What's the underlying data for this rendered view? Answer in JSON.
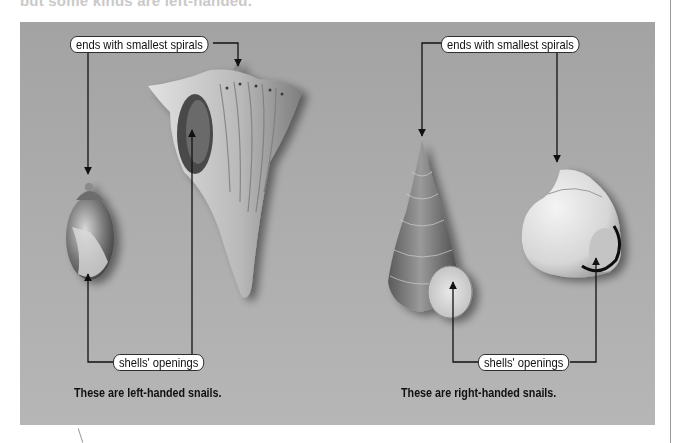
{
  "header": {
    "partial_text": "but some kinds are left-handed."
  },
  "figure": {
    "background_color": "#acacac",
    "left_group": {
      "top_label": "ends with smallest spirals",
      "bottom_label": "shells' openings",
      "caption": "These are left-handed snails.",
      "shells": [
        "small-oval-shell",
        "whelk-conch-shell"
      ]
    },
    "right_group": {
      "top_label": "ends with smallest spirals",
      "bottom_label": "shells' openings",
      "caption": "These are right-handed snails.",
      "shells": [
        "tall-spiral-shell",
        "round-snail-shell"
      ]
    }
  }
}
